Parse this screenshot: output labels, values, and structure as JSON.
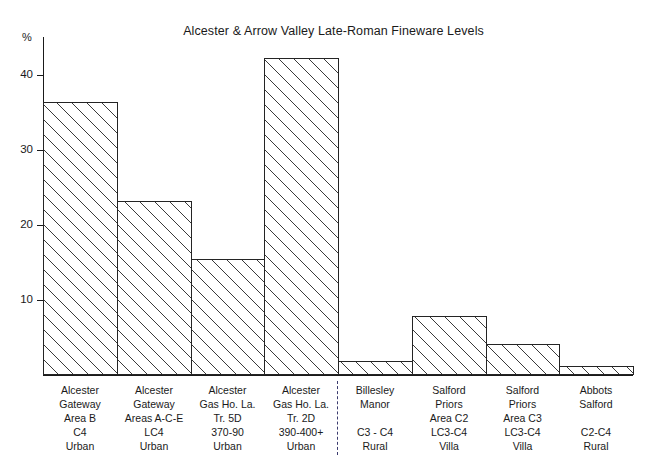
{
  "chart_data": {
    "type": "bar",
    "title": "Alcester & Arrow Valley Late-Roman Fineware Levels",
    "xlabel": "",
    "ylabel": "%",
    "ylim": [
      0,
      45
    ],
    "yticks": [
      10,
      20,
      30,
      40
    ],
    "ytick_labels": [
      "10",
      "20",
      "30",
      "40"
    ],
    "grid": false,
    "legend": null,
    "categories": [
      "Alcester Gateway Area B C4 Urban",
      "Alcester Gateway Areas A-C-E LC4 Urban",
      "Alcester Gas Ho. La. Tr. 5D 370-90 Urban",
      "Alcester Gas Ho. La. Tr. 2D 390-400+ Urban",
      "Billesley Manor C3 - C4 Rural",
      "Salford Priors Area C2 LC3-C4 Villa",
      "Salford Priors Area C3 LC3-C4 Villa",
      "Abbots Salford C2-C4 Rural"
    ],
    "values": [
      36.4,
      23.2,
      15.5,
      42.2,
      1.9,
      7.9,
      4.1,
      1.2
    ],
    "bars": [
      {
        "value": 36.4,
        "label_lines": [
          "Alcester",
          "Gateway",
          "Area B",
          "C4",
          "Urban"
        ],
        "site": "Alcester Gateway",
        "area": "Area B",
        "period": "C4",
        "settlement_type": "Urban",
        "group": "urban"
      },
      {
        "value": 23.2,
        "label_lines": [
          "Alcester",
          "Gateway",
          "Areas A-C-E",
          "LC4",
          "Urban"
        ],
        "site": "Alcester Gateway",
        "area": "Areas A-C-E",
        "period": "LC4",
        "settlement_type": "Urban",
        "group": "urban"
      },
      {
        "value": 15.5,
        "label_lines": [
          "Alcester",
          "Gas Ho. La.",
          "Tr. 5D",
          "370-90",
          "Urban"
        ],
        "site": "Alcester Gas Ho. La.",
        "area": "Tr. 5D",
        "period": "370-90",
        "settlement_type": "Urban",
        "group": "urban"
      },
      {
        "value": 42.2,
        "label_lines": [
          "Alcester",
          "Gas Ho. La.",
          "Tr. 2D",
          "390-400+",
          "Urban"
        ],
        "site": "Alcester Gas Ho. La.",
        "area": "Tr. 2D",
        "period": "390-400+",
        "settlement_type": "Urban",
        "group": "urban"
      },
      {
        "value": 1.9,
        "label_lines": [
          "Billesley",
          "Manor",
          "",
          "C3 - C4",
          "Rural"
        ],
        "site": "Billesley Manor",
        "area": "",
        "period": "C3 - C4",
        "settlement_type": "Rural",
        "group": "rural"
      },
      {
        "value": 7.9,
        "label_lines": [
          "Salford",
          "Priors",
          "Area C2",
          "LC3-C4",
          "Villa"
        ],
        "site": "Salford Priors",
        "area": "Area C2",
        "period": "LC3-C4",
        "settlement_type": "Villa",
        "group": "rural"
      },
      {
        "value": 4.1,
        "label_lines": [
          "Salford",
          "Priors",
          "Area C3",
          "LC3-C4",
          "Villa"
        ],
        "site": "Salford Priors",
        "area": "Area C3",
        "period": "LC3-C4",
        "settlement_type": "Villa",
        "group": "rural"
      },
      {
        "value": 1.2,
        "label_lines": [
          "Abbots",
          "Salford",
          "",
          "C2-C4",
          "Rural"
        ],
        "site": "Abbots Salford",
        "area": "",
        "period": "C2-C4",
        "settlement_type": "Rural",
        "group": "rural"
      }
    ],
    "annotations": [
      {
        "type": "vertical-dashed-divider",
        "after_category_index": 3,
        "color": "#3b3b6e",
        "note": "separates urban Alcester sites from rural/villa sites"
      }
    ],
    "colors": {
      "axis": "#1a1a1a",
      "bar_outline": "#242424",
      "bar_hatch": "#3a3a3a",
      "bar_fill": "#ffffff",
      "divider": "#3b3b6e",
      "background": "#ffffff"
    }
  }
}
